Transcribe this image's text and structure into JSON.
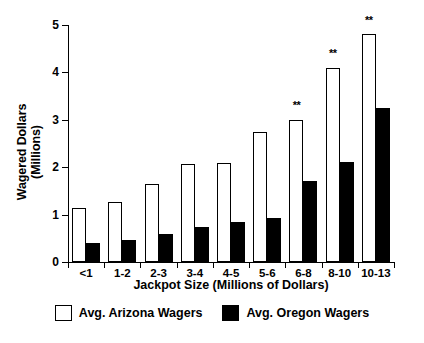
{
  "chart_data": {
    "type": "bar",
    "title": "",
    "xlabel": "Jackpot Size (Millions of Dollars)",
    "ylabel": "Wagered Dollars\n(Millions)",
    "categories": [
      "<1",
      "1-2",
      "2-3",
      "3-4",
      "4-5",
      "5-6",
      "6-8",
      "8-10",
      "10-13"
    ],
    "series": [
      {
        "name": "Avg. Arizona Wagers",
        "color": "#ffffff",
        "values": [
          1.14,
          1.26,
          1.65,
          2.07,
          2.09,
          2.75,
          3.0,
          4.1,
          4.8
        ]
      },
      {
        "name": "Avg. Oregon Wagers",
        "color": "#000000",
        "values": [
          0.4,
          0.46,
          0.6,
          0.74,
          0.85,
          0.92,
          1.7,
          2.1,
          3.25
        ]
      }
    ],
    "ylim": [
      0,
      5
    ],
    "yticks": [
      0,
      1,
      2,
      3,
      4,
      5
    ],
    "ytick_labels": [
      "0",
      "1",
      "2",
      "3",
      "4",
      "5"
    ],
    "grid": false,
    "legend_position": "bottom",
    "annotations": [
      {
        "category": "6-8",
        "text": "**",
        "y": 3.25
      },
      {
        "category": "8-10",
        "text": "**",
        "y": 4.35
      },
      {
        "category": "10-13",
        "text": "**",
        "y": 5.05
      }
    ]
  },
  "legend": {
    "items": [
      {
        "label": "Avg. Arizona Wagers"
      },
      {
        "label": "Avg. Oregon Wagers"
      }
    ]
  }
}
